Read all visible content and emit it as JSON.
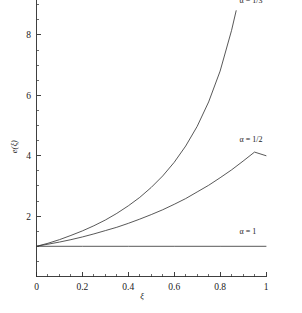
{
  "chart_data": {
    "type": "line",
    "title": "",
    "subtitle": "",
    "xlabel": "ξ",
    "ylabel": "e(ξ)",
    "xlim": [
      0,
      1
    ],
    "ylim": [
      0,
      9.2
    ],
    "grid": false,
    "legend_position": "inline-curve-end",
    "x_ticks": [
      0,
      0.2,
      0.4,
      0.6,
      0.8,
      1
    ],
    "x_tick_labels": [
      "0",
      "0.2",
      "0.4",
      "0.6",
      "0.8",
      "1"
    ],
    "x_minor_step": 0.05,
    "y_ticks": [
      0,
      2,
      4,
      6,
      8
    ],
    "y_tick_labels": [
      "0",
      "2",
      "4",
      "6",
      "8"
    ],
    "y_minor_step": 0.5,
    "series": [
      {
        "name": "α = 1/3",
        "label": "α = 1/3",
        "x": [
          0,
          0.05,
          0.1,
          0.15,
          0.2,
          0.25,
          0.3,
          0.35,
          0.4,
          0.45,
          0.5,
          0.55,
          0.6,
          0.65,
          0.7,
          0.75,
          0.8,
          0.85,
          0.87
        ],
        "values": [
          1,
          1.1,
          1.22,
          1.36,
          1.51,
          1.68,
          1.87,
          2.09,
          2.34,
          2.62,
          2.95,
          3.33,
          3.78,
          4.32,
          4.97,
          5.78,
          6.8,
          8.15,
          8.8
        ]
      },
      {
        "name": "α = 1/2",
        "label": "α = 1/2",
        "x": [
          0,
          0.05,
          0.1,
          0.15,
          0.2,
          0.25,
          0.3,
          0.35,
          0.4,
          0.45,
          0.5,
          0.55,
          0.6,
          0.65,
          0.7,
          0.75,
          0.8,
          0.85,
          0.9,
          0.95,
          1
        ],
        "values": [
          1,
          1.07,
          1.14,
          1.22,
          1.31,
          1.41,
          1.52,
          1.63,
          1.76,
          1.9,
          2.05,
          2.21,
          2.39,
          2.58,
          2.8,
          3.02,
          3.27,
          3.53,
          3.82,
          4.12,
          4.0
        ]
      },
      {
        "name": "α = 1",
        "label": "α = 1",
        "x": [
          0,
          0.2,
          0.4,
          0.6,
          0.8,
          1
        ],
        "values": [
          1,
          1,
          1,
          1,
          1,
          1
        ]
      }
    ],
    "annotations": [
      {
        "text": "α = 1/3",
        "x": 0.885,
        "y": 9.05
      },
      {
        "text": "α = 1/2",
        "x": 0.885,
        "y": 4.45
      },
      {
        "text": "α = 1",
        "x": 0.885,
        "y": 1.4
      }
    ],
    "colors": {
      "background": "#ffffff",
      "axis": "#2b2b2b",
      "curve": "#3a3a3a",
      "text": "#1a1a1a"
    }
  }
}
